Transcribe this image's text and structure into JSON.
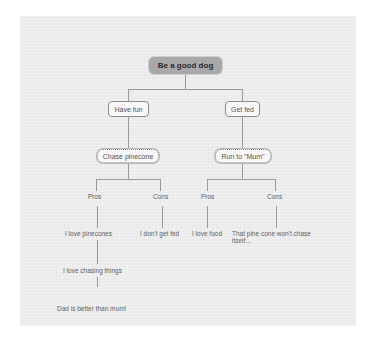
{
  "diagram": {
    "type": "mind-map",
    "root": {
      "label": "Be a good dog"
    },
    "branches": [
      {
        "label": "Have fun",
        "child": {
          "label": "Chase pinecone",
          "pros": {
            "label": "Pros",
            "items": [
              "I love pinecones",
              "I love chasing things",
              "Dad is better than mum!"
            ]
          },
          "cons": {
            "label": "Cons",
            "items": [
              "I don't get fed"
            ]
          }
        }
      },
      {
        "label": "Get fed",
        "child": {
          "label": "Run to \"Mum\"",
          "pros": {
            "label": "Pros",
            "items": [
              "I love food"
            ]
          },
          "cons": {
            "label": "Cons",
            "items": [
              "That pine cone won't chase itself..."
            ]
          }
        }
      }
    ]
  },
  "colors": {
    "canvas": "#ececec",
    "root_fill": "#a9a9a9",
    "node_fill": "#f7f7f7",
    "connector": "#9a9a9a",
    "text": "#555555"
  }
}
